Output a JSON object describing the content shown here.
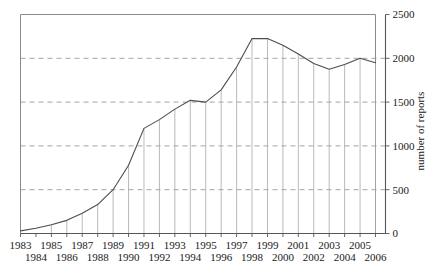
{
  "chart_data": {
    "type": "line",
    "title": "",
    "xlabel": "",
    "ylabel": "number of reports",
    "xlim": [
      1983,
      2006
    ],
    "ylim": [
      0,
      2500
    ],
    "yticks": [
      0,
      500,
      1000,
      1500,
      2000,
      2500
    ],
    "ytick_labels": [
      "0",
      "500",
      "1000",
      "1500",
      "2000",
      "2500"
    ],
    "grid": "horizontal-dashed",
    "legend": "none",
    "drop_lines": true,
    "categories": [
      "1983",
      "1984",
      "1985",
      "1986",
      "1987",
      "1988",
      "1989",
      "1990",
      "1991",
      "1992",
      "1993",
      "1994",
      "1995",
      "1996",
      "1997",
      "1998",
      "1999",
      "2000",
      "2001",
      "2002",
      "2003",
      "2004",
      "2005",
      "2006"
    ],
    "x": [
      1983,
      1984,
      1985,
      1986,
      1987,
      1988,
      1989,
      1990,
      1991,
      1992,
      1993,
      1994,
      1995,
      1996,
      1997,
      1998,
      1999,
      2000,
      2001,
      2002,
      2003,
      2004,
      2005,
      2006
    ],
    "values": [
      30,
      60,
      100,
      150,
      230,
      330,
      500,
      780,
      1200,
      1300,
      1420,
      1520,
      1500,
      1640,
      1900,
      2225,
      2225,
      2150,
      2050,
      1940,
      1875,
      1930,
      2000,
      1950
    ],
    "xtick_labels_top": [
      "1983",
      "1985",
      "1987",
      "1989",
      "1991",
      "1993",
      "1995",
      "1997",
      "1999",
      "2001",
      "2003",
      "2005"
    ],
    "xtick_labels_bottom": [
      "1984",
      "1986",
      "1988",
      "1990",
      "1992",
      "1994",
      "1996",
      "1998",
      "2000",
      "2002",
      "2004",
      "2006"
    ]
  },
  "colors": {
    "data_line": "#4d4d4d",
    "grid": "#9a9a9a",
    "drop_line": "#a8a8a8",
    "axis": "#555555",
    "box": "#8a8a8a",
    "text": "#1a1a1a"
  }
}
